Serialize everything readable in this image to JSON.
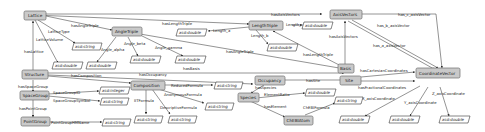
{
  "diagram": {
    "type": "ontology-graph",
    "colors": {
      "class_fill": "#c9c9c9",
      "class_stroke": "#6f6f6f",
      "literal_fill": "#ffffff",
      "edge": "#3a3a3a"
    },
    "classes": {
      "lattice": "Lattice",
      "angle_triple": "AngleTriple",
      "length_triple": "LengthTriple",
      "axis_vectors": "AxisVectors",
      "structure": "Structure",
      "composition": "Composition",
      "occupancy": "Occupancy",
      "basis": "Basis",
      "site": "Site",
      "coordinate_vector": "CoordinateVector",
      "space_group": "SpaceGroup",
      "point_group": "PointGroup",
      "species": "Species",
      "chebi_atom": "ChEBIAtom"
    },
    "literals": {
      "xsd_string": "xsd:string",
      "xsd_double": "xsd:double",
      "xsd_integer": "xsd:integer"
    },
    "edges": {
      "lattice_type": "LatticeType",
      "lattice_volume": "LatticeVolume",
      "has_angle_triple": "hasAngleTriple",
      "has_length_triple": "hasLengthTriple",
      "has_axis_vectors": "hasAxisVectors",
      "angle_alpha": "Angle_alpha",
      "angle_beta": "Angle_beta",
      "angle_gamma": "Angle_gamma",
      "length_a": "Length_a",
      "length_b": "Length_b",
      "length_c": "Length_c",
      "has_a_axis_vector": "has_a_axisVector",
      "has_b_axis_vector": "has_b_axisVector",
      "has_c_axis_vector": "has_c_axisVector",
      "has_lattice": "hasLattice",
      "has_composition": "hasComposition",
      "has_occupancy": "hasOccupancy",
      "has_basis": "hasBasis",
      "has_space_group": "hasSpaceGroup",
      "space_group_id": "SpaceGroupID",
      "space_group_symbol": "SpaceGroupSymbol",
      "has_point_group": "hasPointGroup",
      "point_group_hm_name": "PointGroupHMName",
      "reduced_formula": "ReducedFormula",
      "anonymous_formula": "AnonymousFormula",
      "iit_formula": "IITFormula",
      "descriptive_formula": "DescriptiveFormula",
      "has_species": "hasSpecies",
      "element_ratio": "ElementRatio",
      "has_element": "hasElement",
      "chebi_formula": "ChEBIFormula",
      "has_site": "hasSite",
      "has_cartesian_coordinates": "hasCartesianCoordinates",
      "has_fractional_coordinates": "hasFractionalCoordinates",
      "x_axis_coordinate": "X_axisCoordinate",
      "y_axis_coordinate": "Y_axisCoordinate",
      "z_axis_coordinate": "Z_axisCoordinate"
    }
  }
}
